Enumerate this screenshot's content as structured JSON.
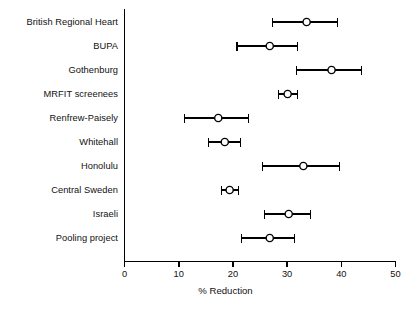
{
  "chart_data": {
    "type": "scatter",
    "subtype": "forest-plot",
    "title": "",
    "xlabel": "% Reduction",
    "ylabel": "",
    "xlim": [
      0,
      50
    ],
    "xticks": [
      0,
      10,
      20,
      30,
      40,
      50
    ],
    "xtick_labels": [
      "0",
      "10",
      "20",
      "30",
      "40",
      "50"
    ],
    "grid": false,
    "legend": null,
    "marker": "open-circle",
    "categories": [
      "British Regional Heart",
      "BUPA",
      "Gothenburg",
      "MRFIT screenees",
      "Renfrew-Paisely",
      "Whitehall",
      "Honolulu",
      "Central Sweden",
      "Israeli",
      "Pooling project"
    ],
    "series": [
      {
        "name": "% Reduction (point estimate with 95% CI)",
        "values": [
          33.6,
          26.8,
          38.2,
          30.1,
          17.3,
          18.5,
          33.0,
          19.4,
          30.3,
          26.8
        ],
        "ci_low": [
          27.3,
          20.8,
          31.7,
          28.4,
          11.1,
          15.5,
          25.5,
          17.9,
          25.8,
          21.6
        ],
        "ci_high": [
          39.3,
          31.9,
          43.7,
          31.9,
          22.9,
          21.4,
          39.7,
          21.0,
          34.3,
          31.4
        ]
      }
    ],
    "points": [
      {
        "label": "British Regional Heart",
        "value": 33.6,
        "low": 27.3,
        "high": 39.3
      },
      {
        "label": "BUPA",
        "value": 26.8,
        "low": 20.8,
        "high": 31.9
      },
      {
        "label": "Gothenburg",
        "value": 38.2,
        "low": 31.7,
        "high": 43.7
      },
      {
        "label": "MRFIT screenees",
        "value": 30.1,
        "low": 28.4,
        "high": 31.9
      },
      {
        "label": "Renfrew-Paisely",
        "value": 17.3,
        "low": 11.1,
        "high": 22.9
      },
      {
        "label": "Whitehall",
        "value": 18.5,
        "low": 15.5,
        "high": 21.4
      },
      {
        "label": "Honolulu",
        "value": 33.0,
        "low": 25.5,
        "high": 39.7
      },
      {
        "label": "Central Sweden",
        "value": 19.4,
        "low": 17.9,
        "high": 21.0
      },
      {
        "label": "Israeli",
        "value": 30.3,
        "low": 25.8,
        "high": 34.3
      },
      {
        "label": "Pooling project",
        "value": 26.8,
        "low": 21.6,
        "high": 31.4
      }
    ],
    "colors": {
      "axis": "#000000",
      "marker_stroke": "#000000",
      "marker_fill": "#ffffff",
      "whisker": "#000000",
      "background": "#ffffff"
    }
  },
  "axis": {
    "x_title": "% Reduction"
  },
  "caption": {
    "text": "",
    "visible": false
  }
}
